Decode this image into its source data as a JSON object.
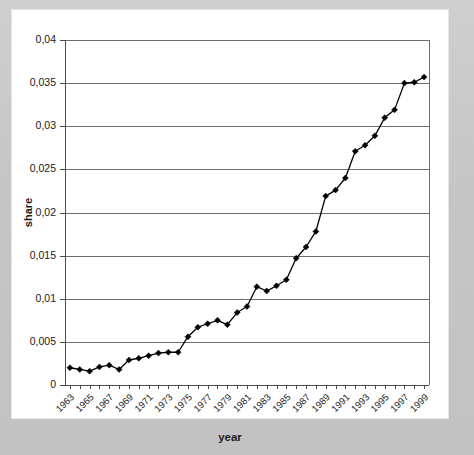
{
  "chart_data": {
    "type": "line",
    "title": "",
    "subtitle": "",
    "xlabel": "year",
    "ylabel": "share",
    "x": [
      1963,
      1964,
      1965,
      1966,
      1967,
      1968,
      1969,
      1970,
      1971,
      1972,
      1973,
      1974,
      1975,
      1976,
      1977,
      1978,
      1979,
      1980,
      1981,
      1982,
      1983,
      1984,
      1985,
      1986,
      1987,
      1988,
      1989,
      1990,
      1991,
      1992,
      1993,
      1994,
      1995,
      1996,
      1997,
      1998,
      1999
    ],
    "values": [
      0.002,
      0.0018,
      0.0016,
      0.0021,
      0.0023,
      0.0018,
      0.0029,
      0.0031,
      0.0034,
      0.0037,
      0.0038,
      0.0038,
      0.0056,
      0.0067,
      0.0071,
      0.0075,
      0.007,
      0.0084,
      0.0091,
      0.0114,
      0.0109,
      0.0115,
      0.0122,
      0.0147,
      0.016,
      0.0178,
      0.0219,
      0.0226,
      0.024,
      0.0271,
      0.0278,
      0.0289,
      0.031,
      0.0319,
      0.035,
      0.0351,
      0.0357
    ],
    "series": [
      {
        "name": "share",
        "values": [
          0.002,
          0.0018,
          0.0016,
          0.0021,
          0.0023,
          0.0018,
          0.0029,
          0.0031,
          0.0034,
          0.0037,
          0.0038,
          0.0038,
          0.0056,
          0.0067,
          0.0071,
          0.0075,
          0.007,
          0.0084,
          0.0091,
          0.0114,
          0.0109,
          0.0115,
          0.0122,
          0.0147,
          0.016,
          0.0178,
          0.0219,
          0.0226,
          0.024,
          0.0271,
          0.0278,
          0.0289,
          0.031,
          0.0319,
          0.035,
          0.0351,
          0.0357
        ],
        "marker": "diamond",
        "color": "#000000"
      }
    ],
    "xtick_labels": [
      "1963",
      "1965",
      "1967",
      "1969",
      "1971",
      "1973",
      "1975",
      "1977",
      "1979",
      "1981",
      "1983",
      "1985",
      "1987",
      "1989",
      "1991",
      "1993",
      "1995",
      "1997",
      "1999"
    ],
    "xtick_values": [
      1963,
      1965,
      1967,
      1969,
      1971,
      1973,
      1975,
      1977,
      1979,
      1981,
      1983,
      1985,
      1987,
      1989,
      1991,
      1993,
      1995,
      1997,
      1999
    ],
    "ytick_labels": [
      "0",
      "0,005",
      "0,01",
      "0,015",
      "0,02",
      "0,025",
      "0,03",
      "0,035",
      "0,04"
    ],
    "ytick_values": [
      0,
      0.005,
      0.01,
      0.015,
      0.02,
      0.025,
      0.03,
      0.035,
      0.04
    ],
    "ylim": [
      0,
      0.04
    ],
    "xlim": [
      1962.5,
      1999.5
    ],
    "grid": "horizontal",
    "legend": "none",
    "decimal_separator": ",",
    "colors": {
      "line": "#000000",
      "marker": "#000000",
      "grid": "#6e6e6e",
      "axis": "#4a4a4a",
      "panel_background": "#ffffff",
      "outer_background": "#c8c8c8",
      "text": "#1a1a1a"
    }
  }
}
